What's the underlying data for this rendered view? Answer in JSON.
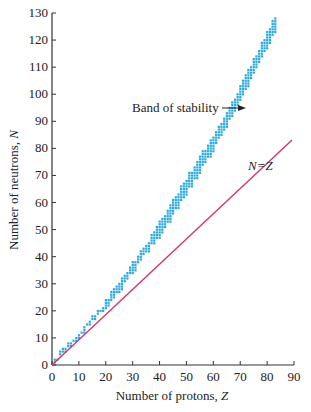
{
  "chart_data": {
    "type": "scatter",
    "title": "",
    "xlabel": "Number of protons, Z",
    "ylabel": "Number of neutrons, N",
    "xlim": [
      0,
      90
    ],
    "ylim": [
      0,
      130
    ],
    "xticks": [
      0,
      10,
      20,
      30,
      40,
      50,
      60,
      70,
      80,
      90
    ],
    "yticks": [
      0,
      10,
      20,
      30,
      40,
      50,
      60,
      70,
      80,
      90,
      100,
      110,
      120,
      130
    ],
    "grid": false,
    "legend": null,
    "series": [
      {
        "name": "Band of stability",
        "color": "#29a9e0",
        "centerline": {
          "Z": [
            0,
            5,
            10,
            15,
            20,
            25,
            30,
            35,
            40,
            45,
            50,
            55,
            60,
            65,
            70,
            75,
            80,
            83
          ],
          "N": [
            0,
            6,
            11,
            17,
            22,
            29,
            36,
            43,
            50,
            58,
            66,
            74,
            82,
            91,
            100,
            110,
            120,
            126
          ]
        }
      },
      {
        "name": "N=Z",
        "color": "#d6336c",
        "line": {
          "Z": [
            0,
            90
          ],
          "N": [
            0,
            90
          ]
        }
      }
    ],
    "annotations": [
      {
        "text": "Band of stability",
        "arrow_to": [
          63,
          94
        ]
      },
      {
        "text": "N=Z",
        "at": [
          72,
          76
        ]
      }
    ]
  },
  "labels": {
    "xlabel": "Number of protons, ",
    "xlabel_var": "Z",
    "ylabel": "Number of neutrons, ",
    "ylabel_var": "N",
    "band_label": "Band of stability",
    "line_label": "N=Z"
  }
}
